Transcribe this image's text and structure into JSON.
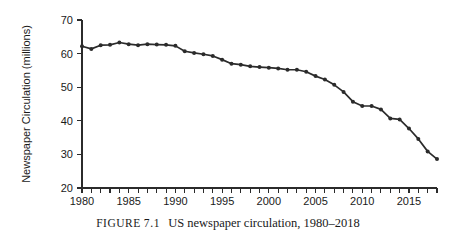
{
  "figure": {
    "label": "FIGURE",
    "number": "7.1",
    "caption_text": "US newspaper circulation, 1980–2018"
  },
  "chart_data": {
    "type": "line",
    "title": "",
    "xlabel": "",
    "ylabel": "Newspaper Circulation (millions)",
    "xlim": [
      1980,
      2018
    ],
    "ylim": [
      20,
      70
    ],
    "grid": false,
    "legend": "none",
    "marker": "filled-circle",
    "line_color": "#2b2b2b",
    "y_ticks": [
      20,
      30,
      40,
      50,
      60,
      70
    ],
    "y_tick_labels": [
      "20",
      "30",
      "40",
      "50",
      "60",
      "70"
    ],
    "x_ticks": [
      1980,
      1985,
      1990,
      1995,
      2000,
      2005,
      2010,
      2015
    ],
    "x_tick_labels": [
      "1980",
      "1985",
      "1990",
      "1995",
      "2000",
      "2005",
      "2010",
      "2015"
    ],
    "x_minor_tick_step": 1,
    "x": [
      1980,
      1981,
      1982,
      1983,
      1984,
      1985,
      1986,
      1987,
      1988,
      1989,
      1990,
      1991,
      1992,
      1993,
      1994,
      1995,
      1996,
      1997,
      1998,
      1999,
      2000,
      2001,
      2002,
      2003,
      2004,
      2005,
      2006,
      2007,
      2008,
      2009,
      2010,
      2011,
      2012,
      2013,
      2014,
      2015,
      2016,
      2017,
      2018
    ],
    "values": [
      62.2,
      61.4,
      62.5,
      62.6,
      63.3,
      62.8,
      62.5,
      62.8,
      62.7,
      62.6,
      62.3,
      60.7,
      60.2,
      59.8,
      59.3,
      58.2,
      57.0,
      56.7,
      56.2,
      56.0,
      55.8,
      55.6,
      55.2,
      55.2,
      54.6,
      53.3,
      52.3,
      50.7,
      48.6,
      45.7,
      44.4,
      44.4,
      43.4,
      40.7,
      40.4,
      37.7,
      34.6,
      30.9,
      28.6
    ]
  },
  "chart_geometry": {
    "plot_left": 82,
    "plot_right": 437,
    "plot_top": 20,
    "plot_bottom": 188,
    "tick_len": 5,
    "point_radius": 2.0
  }
}
